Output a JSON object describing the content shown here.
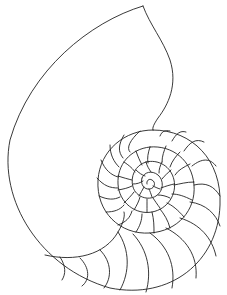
{
  "image": {
    "subject": "Nautilus shell line drawing",
    "stroke_color": "#222222",
    "background_color": "#ffffff"
  }
}
